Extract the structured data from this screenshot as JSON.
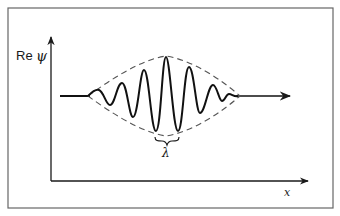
{
  "diagram": {
    "y_axis_label_prefix": "Re",
    "y_axis_label_symbol": "ψ",
    "x_axis_label": "x",
    "wavelength_label": "λ",
    "colors": {
      "frame": "#555555",
      "axis": "#1a1a1a",
      "wave": "#111111",
      "envelope": "#555555"
    }
  }
}
